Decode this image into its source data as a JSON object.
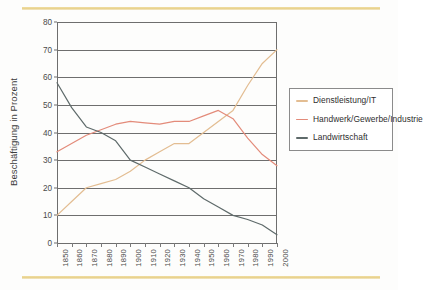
{
  "colors": {
    "accent_bar": "#e8d089",
    "background": "#fdfdfc",
    "axis": "#6e6e6e",
    "dienstleistung": "#e3bd92",
    "handwerk": "#e38b7a",
    "landwirtschaft": "#5e6a6a",
    "legend_border": "#8b8b8b",
    "text": "#3b3b3b"
  },
  "chart_data": {
    "type": "line",
    "title": "",
    "xlabel": "",
    "ylabel": "Beschäftigung in Prozent",
    "ylim": [
      0,
      80
    ],
    "ytick_step": 10,
    "yticks": [
      0,
      10,
      20,
      30,
      40,
      50,
      60,
      70,
      80
    ],
    "grid": true,
    "legend_position": "right",
    "categories": [
      "1850",
      "1860",
      "1870",
      "1880",
      "1890",
      "1900",
      "1910",
      "1920",
      "1930",
      "1940",
      "1950",
      "1960",
      "1970",
      "1980",
      "1990",
      "2000"
    ],
    "x": [
      1850,
      1860,
      1870,
      1880,
      1890,
      1900,
      1910,
      1920,
      1930,
      1940,
      1950,
      1960,
      1970,
      1980,
      1990,
      2000
    ],
    "series": [
      {
        "name": "Dienstleistung/IT",
        "color": "#e3bd92",
        "values": [
          10,
          15,
          20,
          21.5,
          23,
          26,
          30,
          33,
          36,
          36,
          40,
          44,
          48,
          57,
          65,
          70
        ]
      },
      {
        "name": "Handwerk/Gewerbe/Industrie",
        "color": "#e38b7a",
        "values": [
          33,
          36,
          39,
          41,
          43,
          44,
          43.5,
          43,
          44,
          44,
          46,
          48,
          45,
          38,
          32,
          28
        ]
      },
      {
        "name": "Landwirtschaft",
        "color": "#5e6a6a",
        "values": [
          58,
          49,
          42,
          40,
          37,
          30,
          27.5,
          25,
          22.5,
          20,
          16,
          13,
          10,
          8.5,
          6.5,
          3
        ]
      }
    ]
  },
  "legend": {
    "entries": [
      {
        "label": "Dienstleistung/IT"
      },
      {
        "label": "Handwerk/Gewerbe/Industrie"
      },
      {
        "label": "Landwirtschaft"
      }
    ]
  }
}
